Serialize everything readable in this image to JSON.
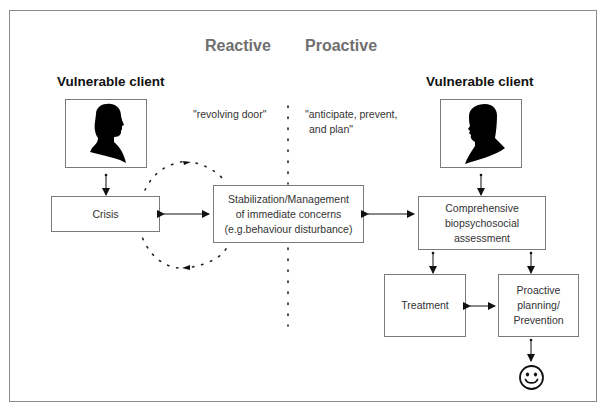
{
  "diagram": {
    "headings": {
      "reactive": "Reactive",
      "proactive": "Proactive"
    },
    "left_client": {
      "title": "Vulnerable client",
      "icon": "male-silhouette-icon"
    },
    "right_client": {
      "title": "Vulnerable client",
      "icon": "female-silhouette-icon"
    },
    "quotes": {
      "reactive": "\"revolving door\"",
      "proactive_line1": "\"anticipate, prevent,",
      "proactive_line2": "and plan\""
    },
    "boxes": {
      "crisis": "Crisis",
      "stabilization_line1": "Stabilization/Management",
      "stabilization_line2": "of immediate concerns",
      "stabilization_line3": "(e.g.behaviour disturbance)",
      "assessment_line1": "Comprehensive",
      "assessment_line2": "biopsychosocial",
      "assessment_line3": "assessment",
      "treatment": "Treatment",
      "planning_line1": "Proactive",
      "planning_line2": "planning/",
      "planning_line3": "Prevention"
    },
    "outcome_icon": "smiley-face-icon",
    "colors": {
      "border": "#7a7a7a",
      "heading": "#6f6f6f",
      "text": "#333333",
      "silhouette": "#000000"
    }
  }
}
